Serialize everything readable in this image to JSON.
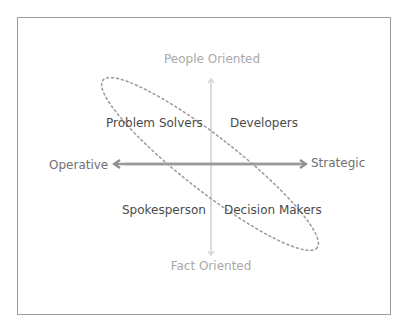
{
  "diagram": {
    "type": "quadrant",
    "axes": {
      "vertical": {
        "top_label": "People Oriented",
        "bottom_label": "Fact Oriented",
        "color": "#dcdcdc"
      },
      "horizontal": {
        "left_label": "Operative",
        "right_label": "Strategic",
        "color": "#9a9a9a"
      }
    },
    "quadrants": {
      "top_left": "Problem Solvers",
      "top_right": "Developers",
      "bottom_left": "Spokesperson",
      "bottom_right": "Decision Makers"
    },
    "highlight": {
      "shape": "dotted-ellipse",
      "encloses": [
        "Problem Solvers",
        "Decision Makers"
      ],
      "color": "#9a9a9a"
    },
    "colors": {
      "frame_border": "#9c9c9c",
      "vertical_label": "#a9a9a9",
      "horizontal_label": "#6f6f6f",
      "quadrant_text": "#4a4a4a"
    }
  }
}
